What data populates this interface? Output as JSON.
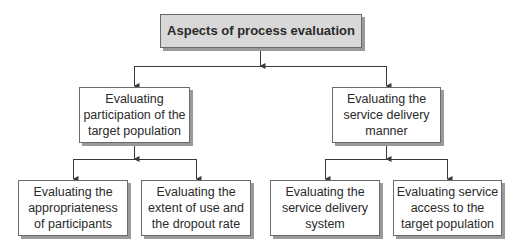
{
  "diagram": {
    "root": {
      "label": "Aspects of process evaluation"
    },
    "branches": [
      {
        "label": "Evaluating\nparticipation of the\ntarget population",
        "children": [
          {
            "label": "Evaluating the\nappropriateness\nof participants"
          },
          {
            "label": "Evaluating the\nextent of use and\nthe dropout rate"
          }
        ]
      },
      {
        "label": "Evaluating the\nservice delivery\nmanner",
        "children": [
          {
            "label": "Evaluating the\nservice delivery\nsystem"
          },
          {
            "label": "Evaluating service\naccess to the\ntarget population"
          }
        ]
      }
    ]
  },
  "colors": {
    "root_fill": "#d8d8d8",
    "node_fill": "#ffffff",
    "border": "#6a6a6a",
    "shadow": "#9a9a9a",
    "connector": "#3a3a3a"
  }
}
